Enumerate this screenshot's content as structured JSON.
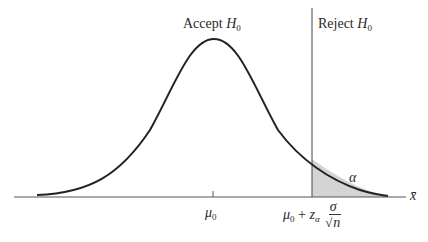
{
  "diagram": {
    "type": "normal-distribution-hypothesis-test",
    "labels": {
      "accept": "Accept ",
      "accept_sym": "H",
      "accept_sub": "0",
      "reject": "Reject ",
      "reject_sym": "H",
      "reject_sub": "0",
      "alpha": "α",
      "x_axis": "x̄",
      "mu": "μ",
      "mu_sub": "0",
      "crit_mu": "μ",
      "crit_mu_sub": "0",
      "crit_plus": " + ",
      "crit_z": "z",
      "crit_z_sub": "α",
      "crit_num": "σ",
      "crit_root": "√",
      "crit_den": "n"
    },
    "colors": {
      "curve": "#222222",
      "axis": "#555555",
      "shade": "#d4d4d4"
    }
  }
}
